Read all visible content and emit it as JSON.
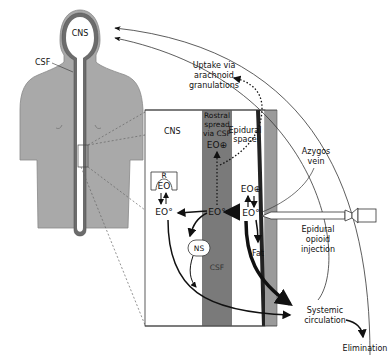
{
  "figure": {
    "colors": {
      "body": "#a9a9a9",
      "csf_column": "#7a7a7a",
      "dura_dark": "#555555",
      "ligament": "#9a9a9a",
      "line": "#111111",
      "background": "#ffffff"
    }
  },
  "body_labels": {
    "cns_head": "CNS",
    "csf": "CSF"
  },
  "inset": {
    "cns": "CNS",
    "rostral_spread": [
      "Rostral",
      "spread",
      "via CSF"
    ],
    "epidural_space": [
      "Epidural",
      "space"
    ],
    "csf": "CSF",
    "receptor": "R",
    "eo_receptor": "EO",
    "eo_cns": "EO°",
    "eo_csf": "EO°",
    "eo_csf_rostral": "EO⊕",
    "eo_epidural_ionized": "EO⊕",
    "eo_epidural": "EO°",
    "ns": "NS",
    "fat": "Fat"
  },
  "outside_labels": {
    "uptake": [
      "Uptake via",
      "arachnoid",
      "granulations"
    ],
    "azygos": [
      "Azygos",
      "vein"
    ],
    "injection": [
      "Epidural",
      "opioid",
      "injection"
    ],
    "systemic": [
      "Systemic",
      "circulation"
    ],
    "elimination": "Elimination"
  }
}
